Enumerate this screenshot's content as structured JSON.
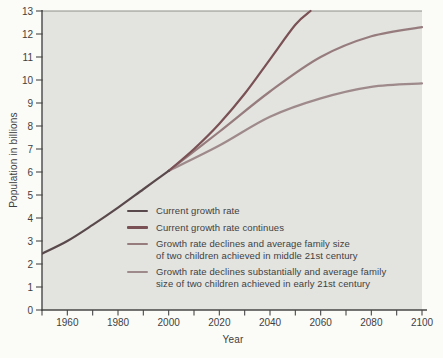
{
  "chart_data": {
    "type": "line",
    "title": "",
    "xlabel": "Year",
    "ylabel": "Population in billions",
    "xlim": [
      1950,
      2100
    ],
    "ylim": [
      0,
      13
    ],
    "x_ticks_labeled": [
      1960,
      1980,
      2000,
      2020,
      2040,
      2060,
      2080,
      2100
    ],
    "x_tick_minor_step": 10,
    "y_ticks": [
      0,
      1,
      2,
      3,
      4,
      5,
      6,
      7,
      8,
      9,
      10,
      11,
      12,
      13
    ],
    "grid": false,
    "legend_position": "inside bottom-left",
    "colors": {
      "plot_bg": "#e3e3df",
      "axis": "#474747",
      "frame": "#8f8f8a",
      "text": "#3f3f3f"
    },
    "series": [
      {
        "name": "Current growth rate",
        "color": "#59494c",
        "points": [
          [
            1950,
            2.45
          ],
          [
            1960,
            3.0
          ],
          [
            1970,
            3.7
          ],
          [
            1980,
            4.45
          ],
          [
            1990,
            5.25
          ],
          [
            2000,
            6.05
          ]
        ]
      },
      {
        "name": "Current growth rate continues",
        "color": "#7a5154",
        "points": [
          [
            2000,
            6.05
          ],
          [
            2010,
            7.0
          ],
          [
            2020,
            8.1
          ],
          [
            2030,
            9.4
          ],
          [
            2040,
            10.9
          ],
          [
            2050,
            12.4
          ],
          [
            2056,
            13.0
          ]
        ]
      },
      {
        "name": "Growth rate declines and average family size of two children achieved in middle 21st century",
        "color": "#977c7e",
        "points": [
          [
            2000,
            6.05
          ],
          [
            2020,
            7.75
          ],
          [
            2040,
            9.5
          ],
          [
            2060,
            11.0
          ],
          [
            2080,
            11.9
          ],
          [
            2100,
            12.3
          ]
        ]
      },
      {
        "name": "Growth rate declines substantially and average family size of two children achieved in early 21st century",
        "color": "#9f8a8b",
        "points": [
          [
            2000,
            6.05
          ],
          [
            2020,
            7.15
          ],
          [
            2040,
            8.4
          ],
          [
            2060,
            9.2
          ],
          [
            2080,
            9.7
          ],
          [
            2100,
            9.85
          ]
        ]
      }
    ],
    "legend": {
      "items": [
        {
          "series": 0,
          "lines": [
            "Current growth rate"
          ]
        },
        {
          "series": 1,
          "lines": [
            "Current growth rate continues"
          ]
        },
        {
          "series": 2,
          "lines": [
            "Growth rate declines and average family size",
            "of two children achieved in middle 21st century"
          ]
        },
        {
          "series": 3,
          "lines": [
            "Growth rate declines substantially and average family",
            "size of two children achieved in early 21st century"
          ]
        }
      ]
    }
  }
}
